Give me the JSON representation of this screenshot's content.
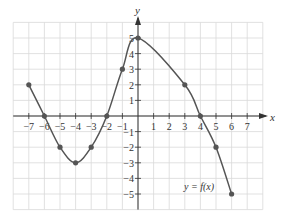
{
  "chart_data": {
    "type": "line",
    "title": "",
    "xlabel": "x",
    "ylabel": "y",
    "xlim": [
      -8,
      8
    ],
    "ylim": [
      -6,
      6
    ],
    "grid": true,
    "x_ticks": [
      -7,
      -6,
      -5,
      -4,
      -3,
      -2,
      -1,
      1,
      2,
      3,
      4,
      5,
      6,
      7
    ],
    "y_ticks": [
      -5,
      -4,
      -3,
      -2,
      -1,
      1,
      2,
      3,
      4,
      5
    ],
    "x_tick_labels": [
      "−7",
      "−6",
      "−5",
      "−4",
      "−3",
      "−2",
      "−1",
      "1",
      "2",
      "3",
      "4",
      "5",
      "6",
      "7"
    ],
    "y_tick_labels": [
      "−5",
      "−4",
      "−3",
      "−2",
      "−1",
      "1",
      "2",
      "3",
      "4",
      "5"
    ],
    "annotation": "y = f(x)",
    "series": [
      {
        "name": "y = f(x)",
        "points": [
          {
            "x": -7,
            "y": 2
          },
          {
            "x": -6,
            "y": 0
          },
          {
            "x": -5,
            "y": -2
          },
          {
            "x": -4,
            "y": -3
          },
          {
            "x": -3,
            "y": -2
          },
          {
            "x": -2,
            "y": 0
          },
          {
            "x": -1,
            "y": 3
          },
          {
            "x": 0,
            "y": 5
          },
          {
            "x": 3,
            "y": 2
          },
          {
            "x": 4,
            "y": 0
          },
          {
            "x": 5,
            "y": -2
          },
          {
            "x": 6,
            "y": -5
          }
        ]
      }
    ],
    "colors": {
      "curve": "#555555",
      "points": "#555555",
      "grid": "#d9d9d9",
      "axes": "#333333"
    }
  }
}
